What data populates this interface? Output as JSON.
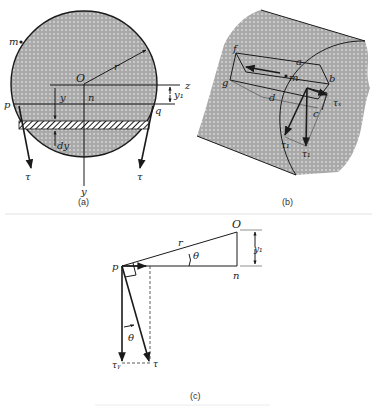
{
  "figure": {
    "panels": [
      {
        "id": "a",
        "caption": "(a)",
        "labels": {
          "m": "m",
          "O": "O",
          "r": "r",
          "z": "z",
          "y1": "y₁",
          "p": "p",
          "q": "q",
          "n": "n",
          "y": "y",
          "dy": "dy",
          "tau_left": "τ",
          "tau_right": "τ",
          "y_axis": "y"
        }
      },
      {
        "id": "b",
        "caption": "(b)",
        "labels": {
          "f": "f",
          "a": "a",
          "g": "g",
          "m": "m",
          "b": "b",
          "d": "d",
          "c": "c",
          "tau_x": "τₓ",
          "tau_1": "τ₁",
          "tau_2": "τ₁"
        }
      },
      {
        "id": "c",
        "caption": "(c)",
        "labels": {
          "O": "O",
          "r": "r",
          "theta_top": "θ",
          "y1": "y₁",
          "p": "p",
          "n": "n",
          "theta_bottom": "θ",
          "tau_y": "τᵧ",
          "tau": "τ"
        }
      }
    ],
    "colors": {
      "fill": "#b8b8b8",
      "ink": "#1a1a1a",
      "background": "#ffffff"
    }
  }
}
